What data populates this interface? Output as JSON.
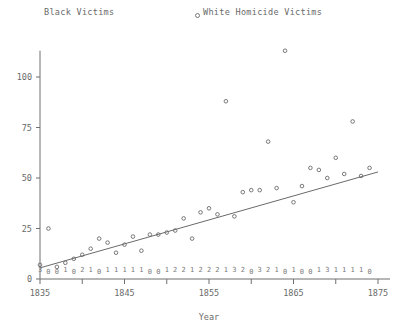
{
  "legend": {
    "left_label": "Black Victims",
    "right_label": "White Homicide Victims",
    "right_marker": "open-circle-marker"
  },
  "axes": {
    "x_title": "Year",
    "y_title": "",
    "x_ticks": [
      1835,
      1840,
      1845,
      1850,
      1855,
      1860,
      1865,
      1870,
      1875
    ],
    "x_tick_labels": [
      "1835",
      "",
      "1845",
      "",
      "1855",
      "",
      "1865",
      "",
      "1875"
    ],
    "y_ticks": [
      0,
      25,
      50,
      75,
      100
    ],
    "y_tick_labels": [
      "0",
      "25",
      "50",
      "75",
      "100"
    ],
    "xlim": [
      1835,
      1875
    ],
    "ylim": [
      0,
      113
    ]
  },
  "chart_data": {
    "type": "scatter",
    "title": "",
    "xlabel": "Year",
    "ylabel": "",
    "grid": false,
    "legend_position": "top",
    "xlim": [
      1835,
      1875
    ],
    "ylim": [
      0,
      115
    ],
    "series": [
      {
        "name": "White Homicide Victims",
        "marker": "open-circle",
        "x": [
          1835,
          1836,
          1837,
          1838,
          1839,
          1840,
          1841,
          1842,
          1843,
          1844,
          1845,
          1846,
          1847,
          1848,
          1849,
          1850,
          1851,
          1852,
          1853,
          1854,
          1855,
          1856,
          1857,
          1858,
          1859,
          1860,
          1861,
          1862,
          1863,
          1864,
          1865,
          1866,
          1867,
          1868,
          1869,
          1870,
          1871,
          1872,
          1873,
          1874
        ],
        "values": [
          7,
          25,
          6,
          8,
          10,
          12,
          15,
          20,
          18,
          13,
          17,
          21,
          14,
          22,
          22,
          23,
          24,
          30,
          20,
          33,
          35,
          32,
          88,
          31,
          43,
          44,
          44,
          68,
          45,
          113,
          38,
          46,
          55,
          54,
          50,
          60,
          52,
          78,
          51,
          55
        ]
      },
      {
        "name": "Black Victims",
        "marker": "numeric-label",
        "x": [
          1835,
          1836,
          1837,
          1838,
          1839,
          1840,
          1841,
          1842,
          1843,
          1844,
          1845,
          1846,
          1847,
          1848,
          1849,
          1850,
          1851,
          1852,
          1853,
          1854,
          1855,
          1856,
          1857,
          1858,
          1859,
          1860,
          1861,
          1862,
          1863,
          1864,
          1865,
          1866,
          1867,
          1868,
          1869,
          1870,
          1871,
          1872,
          1873,
          1874
        ],
        "values": [
          3,
          0,
          0,
          1,
          0,
          2,
          1,
          0,
          1,
          1,
          1,
          1,
          1,
          0,
          0,
          1,
          2,
          2,
          1,
          2,
          2,
          2,
          1,
          3,
          2,
          0,
          3,
          2,
          1,
          0,
          1,
          0,
          0,
          1,
          3,
          1,
          1,
          1,
          1,
          0
        ]
      }
    ],
    "trendline": {
      "name": "linear-fit",
      "x_start": 1835,
      "y_start": 5.5,
      "x_end": 1875,
      "y_end": 53.0
    }
  },
  "colors": {
    "axis": "#6f6f6f",
    "marker": "#6a6a6a",
    "trend": "#6a6a6a",
    "text": "#6a6a6a",
    "background": "#ffffff"
  }
}
